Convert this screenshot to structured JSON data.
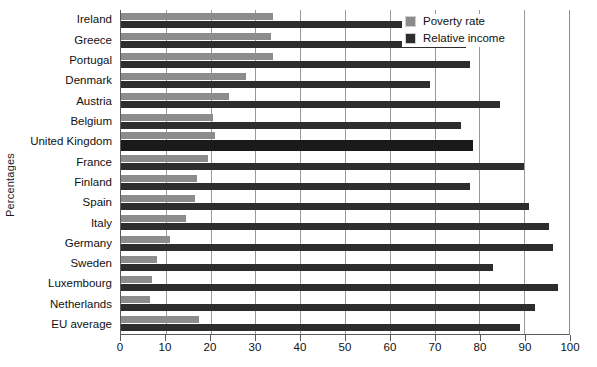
{
  "chart_data": {
    "type": "bar",
    "orientation": "horizontal",
    "title": "",
    "xlabel": "",
    "ylabel": "Percentages",
    "xlim": [
      0,
      100
    ],
    "xticks": [
      0,
      10,
      20,
      30,
      40,
      50,
      60,
      70,
      80,
      90,
      100
    ],
    "grid": true,
    "legend_position": "top-right",
    "highlighted_category": "United Kingdom",
    "categories": [
      "Ireland",
      "Greece",
      "Portugal",
      "Denmark",
      "Austria",
      "Belgium",
      "United Kingdom",
      "France",
      "Finland",
      "Spain",
      "Italy",
      "Germany",
      "Sweden",
      "Luxembourg",
      "Netherlands",
      "EU average"
    ],
    "series": [
      {
        "name": "Poverty rate",
        "color": "#8c8c8c",
        "values": [
          34,
          33.5,
          34,
          28,
          24,
          20.5,
          21,
          19.5,
          17,
          16.5,
          14.5,
          11,
          8,
          7,
          6.5,
          17.5
        ]
      },
      {
        "name": "Relative income",
        "color": "#2d2d2d",
        "values": [
          69.5,
          77,
          78,
          69,
          84.5,
          76,
          78.5,
          90,
          78,
          91,
          95.5,
          96.5,
          83,
          97.5,
          92.5,
          89
        ]
      }
    ]
  },
  "legend": {
    "items": [
      {
        "label": "Poverty rate",
        "color": "#8c8c8c"
      },
      {
        "label": "Relative income",
        "color": "#2d2d2d"
      }
    ]
  },
  "axes": {
    "y_title": "Percentages"
  }
}
